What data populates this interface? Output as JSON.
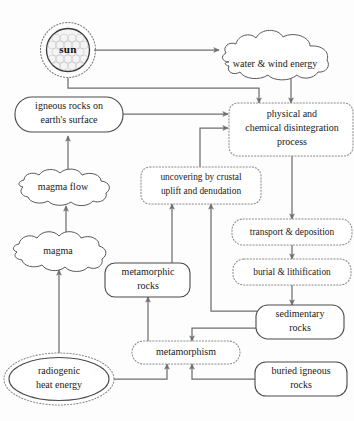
{
  "diagram": {
    "colors": {
      "background": "#fdfdfd",
      "solid_stroke": "#4a4a4a",
      "dotted_stroke": "#8a8a8a",
      "connector": "#6f6f6f",
      "text": "#1a1a1a"
    },
    "nodes": [
      {
        "id": "sun",
        "label": "sun",
        "shape": "radiant-circle",
        "border": "solid-with-dotted-halo",
        "x": 68,
        "y": 50
      },
      {
        "id": "water-wind-energy",
        "label": "water & wind energy",
        "shape": "cloud",
        "border": "solid",
        "x": 272,
        "y": 61
      },
      {
        "id": "igneous-rocks-surface",
        "label_line1": "igneous rocks on",
        "label_line2": "earth's surface",
        "shape": "rounded-rect",
        "border": "solid",
        "x": 68,
        "y": 114
      },
      {
        "id": "physical-chemical-disintegration",
        "label_line1": "physical and",
        "label_line2": "chemical disintegration",
        "label_line3": "process",
        "shape": "rounded-rect",
        "border": "dotted",
        "x": 292,
        "y": 129
      },
      {
        "id": "magma-flow",
        "label": "magma flow",
        "shape": "cloud",
        "border": "solid",
        "x": 66,
        "y": 188
      },
      {
        "id": "uncovering-crustal-uplift",
        "label_line1": "uncovering by crustal",
        "label_line2": "uplift and denudation",
        "shape": "rounded-rect",
        "border": "dotted",
        "x": 200,
        "y": 185
      },
      {
        "id": "transport-deposition",
        "label": "transport & deposition",
        "shape": "rounded-rect",
        "border": "dotted",
        "x": 292,
        "y": 232
      },
      {
        "id": "magma",
        "label": "magma",
        "shape": "cloud",
        "border": "solid",
        "x": 57,
        "y": 252
      },
      {
        "id": "metamorphic-rocks",
        "label_line1": "metamorphic",
        "label_line2": "rocks",
        "shape": "rounded-rect",
        "border": "solid",
        "x": 148,
        "y": 279
      },
      {
        "id": "burial-lithification",
        "label": "burial & lithification",
        "shape": "rounded-rect",
        "border": "dotted",
        "x": 292,
        "y": 272
      },
      {
        "id": "sedimentary-rocks",
        "label_line1": "sedimentary",
        "label_line2": "rocks",
        "shape": "rounded-rect",
        "border": "solid",
        "x": 299,
        "y": 321
      },
      {
        "id": "metamorphism",
        "label": "metamorphism",
        "shape": "rounded-rect",
        "border": "dotted",
        "x": 185,
        "y": 352
      },
      {
        "id": "radiogenic-heat-energy",
        "label_line1": "radiogenic",
        "label_line2": "heat energy",
        "shape": "ellipse",
        "border": "solid-with-dotted-halo",
        "x": 59,
        "y": 379
      },
      {
        "id": "buried-igneous-rocks",
        "label_line1": "buried igneous",
        "label_line2": "rocks",
        "shape": "rounded-rect",
        "border": "solid",
        "x": 299,
        "y": 379
      }
    ],
    "edges": [
      {
        "id": "sun-to-water-wind",
        "from": "sun",
        "to": "water-wind-energy"
      },
      {
        "id": "sun-to-disintegration",
        "from": "sun",
        "to": "physical-chemical-disintegration"
      },
      {
        "id": "water-wind-to-disintegration",
        "from": "water-wind-energy",
        "to": "physical-chemical-disintegration"
      },
      {
        "id": "igneous-surface-to-disintegration",
        "from": "igneous-rocks-surface",
        "to": "physical-chemical-disintegration"
      },
      {
        "id": "uncovering-to-disintegration",
        "from": "uncovering-crustal-uplift",
        "to": "physical-chemical-disintegration"
      },
      {
        "id": "magma-flow-to-igneous-surface",
        "from": "magma-flow",
        "to": "igneous-rocks-surface"
      },
      {
        "id": "magma-to-magma-flow",
        "from": "magma",
        "to": "magma-flow"
      },
      {
        "id": "radiogenic-to-magma",
        "from": "radiogenic-heat-energy",
        "to": "magma"
      },
      {
        "id": "disintegration-to-transport",
        "from": "physical-chemical-disintegration",
        "to": "transport-deposition"
      },
      {
        "id": "transport-to-burial",
        "from": "transport-deposition",
        "to": "burial-lithification"
      },
      {
        "id": "burial-to-sedimentary",
        "from": "burial-lithification",
        "to": "sedimentary-rocks"
      },
      {
        "id": "sedimentary-to-uncovering",
        "from": "sedimentary-rocks",
        "to": "uncovering-crustal-uplift"
      },
      {
        "id": "sedimentary-to-metamorphism",
        "from": "sedimentary-rocks",
        "to": "metamorphism"
      },
      {
        "id": "metamorphic-to-uncovering",
        "from": "metamorphic-rocks",
        "to": "uncovering-crustal-uplift"
      },
      {
        "id": "metamorphism-to-metamorphic",
        "from": "metamorphism",
        "to": "metamorphic-rocks"
      },
      {
        "id": "radiogenic-to-metamorphism",
        "from": "radiogenic-heat-energy",
        "to": "metamorphism"
      },
      {
        "id": "buried-igneous-to-metamorphism",
        "from": "buried-igneous-rocks",
        "to": "metamorphism"
      }
    ]
  }
}
